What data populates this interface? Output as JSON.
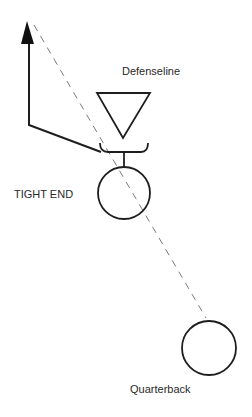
{
  "diagram": {
    "type": "football-play",
    "labels": {
      "defenseline": "Defenseline",
      "tight_end": "TIGHT END",
      "quarterback": "Quarterback"
    },
    "colors": {
      "stroke": "#1e1e1e",
      "dash": "#7a7a7a",
      "text": "#2a2a2a",
      "background": "#ffffff"
    },
    "elements": [
      {
        "id": "defender",
        "shape": "triangle-down",
        "label_ref": "defenseline"
      },
      {
        "id": "block-bracket",
        "shape": "bracket",
        "note": "block between tight end and defender"
      },
      {
        "id": "tight-end",
        "shape": "circle",
        "label_ref": "tight_end"
      },
      {
        "id": "quarterback",
        "shape": "circle",
        "label_ref": "quarterback"
      },
      {
        "id": "route",
        "shape": "arrow-path",
        "note": "tight end route: release left then vertical upfield"
      },
      {
        "id": "pass",
        "shape": "dashed-line",
        "note": "pass from quarterback toward route end"
      }
    ]
  }
}
